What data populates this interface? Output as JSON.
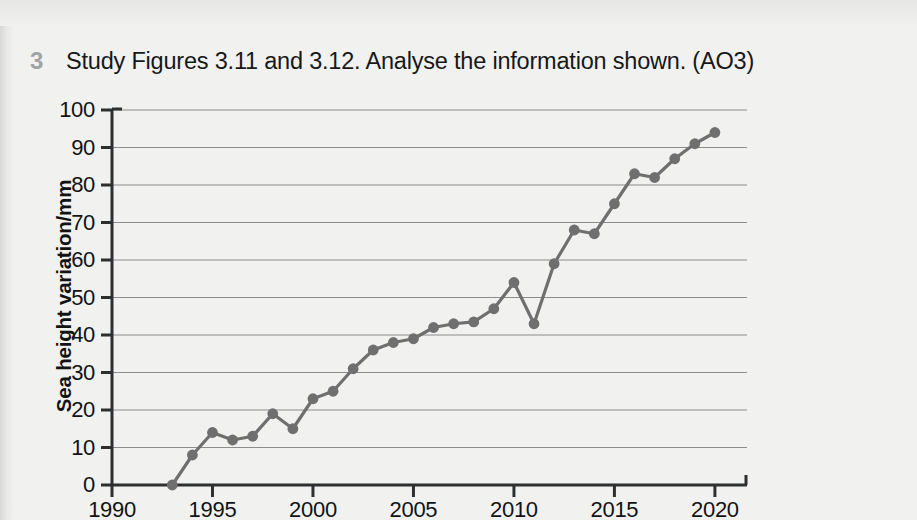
{
  "question": {
    "number": "3",
    "text": "Study Figures 3.11 and 3.12. Analyse the information shown. (AO3)"
  },
  "colors": {
    "page_background": "#f1f1f0",
    "series": "#6f6f6f",
    "axis": "#2d2f31",
    "gridline": "#8c8c8c",
    "text": "#16181a",
    "question_number": "#a2a2a2"
  },
  "chart_data": {
    "type": "line",
    "title": "",
    "subtitle": "",
    "xlabel": "",
    "ylabel": "Sea height variation/mm",
    "xlim": [
      1990,
      2021
    ],
    "ylim": [
      0,
      100
    ],
    "grid": "horizontal",
    "legend": "none",
    "markers": true,
    "x_ticks": [
      1990,
      1995,
      2000,
      2005,
      2010,
      2015,
      2020
    ],
    "x_tick_labels": [
      "1990",
      "1995",
      "2000",
      "2005",
      "2010",
      "2015",
      "2020"
    ],
    "y_ticks": [
      0,
      10,
      20,
      30,
      40,
      50,
      60,
      70,
      80,
      90,
      100
    ],
    "y_tick_labels": [
      "0",
      "10",
      "20",
      "30",
      "40",
      "50",
      "60",
      "70",
      "80",
      "90",
      "100"
    ],
    "x": [
      1993,
      1994,
      1995,
      1996,
      1997,
      1998,
      1999,
      2000,
      2001,
      2002,
      2003,
      2004,
      2005,
      2006,
      2007,
      2008,
      2009,
      2010,
      2011,
      2012,
      2013,
      2014,
      2015,
      2016,
      2017,
      2018,
      2019,
      2020
    ],
    "series": [
      {
        "name": "Sea height variation",
        "values": [
          0,
          8,
          14,
          12,
          13,
          19,
          15,
          23,
          25,
          31,
          36,
          38,
          39,
          42,
          43,
          43.5,
          47,
          54,
          43,
          59,
          68,
          67,
          75,
          83,
          82,
          87,
          91,
          94
        ]
      }
    ]
  }
}
